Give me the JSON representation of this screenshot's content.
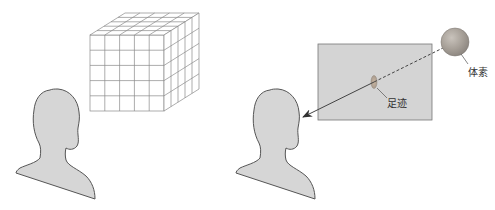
{
  "figure": {
    "left_panel": {
      "description": "Viewer head facing a voxel grid cube",
      "cube": {
        "divisions": 5
      }
    },
    "right_panel": {
      "description": "A voxel projected onto an image plane, forming a footprint, along a ray toward the viewer",
      "labels": {
        "voxel": "体素",
        "footprint": "足迹"
      }
    },
    "colors": {
      "head_fill": "#d6d6d6",
      "head_stroke": "#555555",
      "grid_stroke": "#8a8a8a",
      "plane_fill": "#d4d4d4",
      "plane_stroke": "#777777",
      "sphere_fill": "#a8a19a",
      "ray": "#444444",
      "footprint": "#b7a596"
    }
  }
}
